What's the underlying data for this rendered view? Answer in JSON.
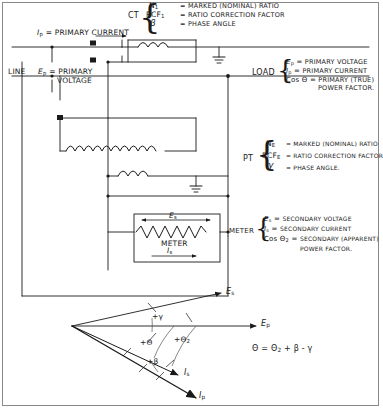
{
  "diagram": {
    "ink_color": "#1a1a1a",
    "frame_color": "#888888"
  },
  "ct_legend": {
    "device_label": "CT",
    "rows": [
      {
        "symbol": "N",
        "subscript": "1",
        "equals": "=",
        "text": "MARKED (NOMINAL) RATIO"
      },
      {
        "symbol": "RCF",
        "subscript": "1",
        "equals": "=",
        "text": "RATIO CORRECTION FACTOR"
      },
      {
        "symbol": "β",
        "subscript": "",
        "equals": "=",
        "text": "PHASE ANGLE"
      }
    ]
  },
  "pt_legend": {
    "device_label": "PT",
    "rows": [
      {
        "symbol": "N",
        "subscript": "E",
        "equals": "=",
        "text": "MARKED (NOMINAL) RATIO"
      },
      {
        "symbol": "RCF",
        "subscript": "E",
        "equals": "=",
        "text": "RATIO CORRECTION FACTOR"
      },
      {
        "symbol": "γ",
        "subscript": "",
        "equals": "=",
        "text": "PHASE ANGLE."
      }
    ]
  },
  "load_legend": {
    "device_label": "LOAD",
    "rows": [
      {
        "symbol": "E",
        "subscript": "p",
        "equals": "=",
        "text": "PRIMARY VOLTAGE"
      },
      {
        "symbol": "I",
        "subscript": "p",
        "equals": "=",
        "text": "PRIMARY CURRENT"
      },
      {
        "symbol": "Cos Θ",
        "subscript": "",
        "equals": "=",
        "text": "PRIMARY (TRUE)"
      }
    ],
    "row3_cont": "POWER FACTOR."
  },
  "meter_legend": {
    "device_label": "METER",
    "rows": [
      {
        "symbol": "E",
        "subscript": "s",
        "equals": "=",
        "text": "SECONDARY VOLTAGE"
      },
      {
        "symbol": "I",
        "subscript": "s",
        "equals": "=",
        "text": "SECONDARY CURRENT"
      },
      {
        "symbol": "Cos Θ",
        "subscript": "2",
        "equals": "=",
        "text": "SECONDARY (APPARENT)"
      }
    ],
    "row3_cont": "POWER FACTOR."
  },
  "circuit": {
    "line_label": "LINE",
    "primary_current_label": "I",
    "primary_current_sub": "p",
    "primary_current_text": "= PRIMARY CURRENT",
    "primary_voltage_label": "E",
    "primary_voltage_sub": "p",
    "primary_voltage_text": "= PRIMARY",
    "primary_voltage_text2": "VOLTAGE",
    "meter_box": {
      "voltage_symbol": "E",
      "voltage_sub": "s",
      "name": "METER",
      "current_symbol": "I",
      "current_sub": "s"
    }
  },
  "phasor": {
    "vectors": [
      {
        "name": "Es",
        "symbol": "E",
        "subscript": "s",
        "angle_deg": 12.5,
        "length": 152
      },
      {
        "name": "Ep",
        "symbol": "E",
        "subscript": "p",
        "angle_deg": 0.0,
        "length": 190
      },
      {
        "name": "Is",
        "symbol": "I",
        "subscript": "s",
        "angle_deg": -40.0,
        "length": 138
      },
      {
        "name": "Ip",
        "symbol": "I",
        "subscript": "p",
        "angle_deg": -50.0,
        "length": 186
      }
    ],
    "angle_labels": [
      {
        "text": "+γ",
        "of": "between Es and Ep"
      },
      {
        "text": "+Θ",
        "of": "between Ep and Ip"
      },
      {
        "text": "+Θ",
        "subscript": "2",
        "of": "between Ep and Is"
      },
      {
        "text": "+β",
        "of": "between Is and Ip"
      }
    ],
    "equation": "Θ = Θ",
    "equation_sub": "2",
    "equation_tail": "+ β - γ"
  }
}
